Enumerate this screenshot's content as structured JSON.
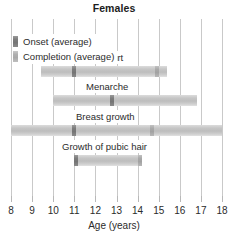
{
  "chart_data": {
    "type": "bar",
    "title": "Females",
    "xlabel": "Age (years)",
    "ylabel": "",
    "xlim": [
      8,
      18
    ],
    "xticks": [
      8,
      9,
      10,
      11,
      12,
      13,
      14,
      15,
      16,
      17,
      18
    ],
    "xtick_labels": [
      "8",
      "9",
      "10",
      "11",
      "12",
      "13",
      "14",
      "15",
      "16",
      "17",
      "18"
    ],
    "grid": true,
    "legend_position": "top-left",
    "legend": [
      {
        "key": "onset",
        "label": "Onset (average)",
        "color": "#7c7c7c"
      },
      {
        "key": "completion",
        "label": "Completion (average)",
        "color": "#b0b0b0"
      }
    ],
    "categories": [
      "Height spurt",
      "Menarche",
      "Breast growth",
      "Growth of pubic hair"
    ],
    "bars": [
      {
        "label": "Height spurt",
        "start": 9.4,
        "end": 15.4,
        "onset_average": 11.0,
        "completion_average": 14.9
      },
      {
        "label": "Menarche",
        "start": 10.0,
        "end": 16.8,
        "onset_average": 12.8,
        "completion_average": null
      },
      {
        "label": "Breast growth",
        "start": 8.0,
        "end": 18.0,
        "onset_average": 11.0,
        "completion_average": 14.7
      },
      {
        "label": "Growth of pubic hair",
        "start": 11.0,
        "end": 14.2,
        "onset_average": 11.1,
        "completion_average": 14.1
      }
    ]
  }
}
